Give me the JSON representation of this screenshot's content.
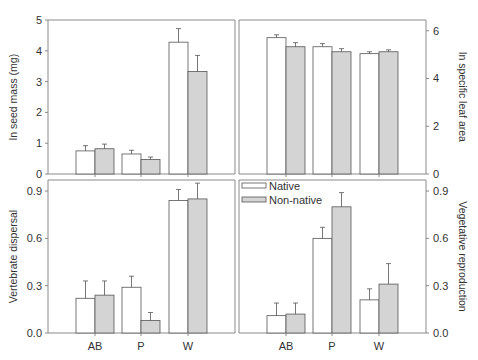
{
  "chart_data": [
    {
      "type": "bar",
      "panel": "top-left",
      "title": "",
      "xlabel": "",
      "ylabel": "ln seed mass (mg)",
      "yaxis_side": "left",
      "ylim": [
        0,
        5
      ],
      "yticks": [
        "0",
        "1",
        "2",
        "3",
        "4",
        "5"
      ],
      "ytick_values": [
        0,
        1,
        2,
        3,
        4,
        5
      ],
      "categories": [
        "AB",
        "P",
        "W"
      ],
      "show_category_labels": false,
      "grid": false,
      "series": [
        {
          "name": "Native",
          "values": [
            0.75,
            0.65,
            4.28
          ],
          "errors": [
            0.17,
            0.12,
            0.44
          ]
        },
        {
          "name": "Non-native",
          "values": [
            0.82,
            0.47,
            3.33
          ],
          "errors": [
            0.15,
            0.08,
            0.52
          ]
        }
      ]
    },
    {
      "type": "bar",
      "panel": "top-right",
      "title": "",
      "xlabel": "",
      "ylabel": "ln specific leaf area",
      "yaxis_side": "right",
      "ylim": [
        0,
        6.45
      ],
      "yticks": [
        "0",
        "2",
        "4",
        "6"
      ],
      "ytick_values": [
        0,
        2,
        4,
        6
      ],
      "categories": [
        "AB",
        "P",
        "W"
      ],
      "show_category_labels": false,
      "grid": false,
      "series": [
        {
          "name": "Native",
          "values": [
            5.71,
            5.33,
            5.04
          ],
          "errors": [
            0.12,
            0.13,
            0.08
          ]
        },
        {
          "name": "Non-native",
          "values": [
            5.33,
            5.12,
            5.12
          ],
          "errors": [
            0.17,
            0.13,
            0.08
          ]
        }
      ]
    },
    {
      "type": "bar",
      "panel": "bottom-left",
      "title": "",
      "xlabel": "",
      "ylabel": "Vertebrate dispersal",
      "yaxis_side": "left",
      "ylim": [
        0,
        0.97
      ],
      "yticks": [
        "0.0",
        "0.3",
        "0.6",
        "0.9"
      ],
      "ytick_values": [
        0,
        0.3,
        0.6,
        0.9
      ],
      "categories": [
        "AB",
        "P",
        "W"
      ],
      "show_category_labels": true,
      "grid": false,
      "series": [
        {
          "name": "Native",
          "values": [
            0.22,
            0.29,
            0.84
          ],
          "errors": [
            0.11,
            0.07,
            0.07
          ]
        },
        {
          "name": "Non-native",
          "values": [
            0.24,
            0.08,
            0.85
          ],
          "errors": [
            0.09,
            0.05,
            0.1
          ]
        }
      ]
    },
    {
      "type": "bar",
      "panel": "bottom-right",
      "title": "",
      "xlabel": "",
      "ylabel": "Vegetative reproduction",
      "yaxis_side": "right",
      "ylim": [
        0,
        0.97
      ],
      "yticks": [
        "0.0",
        "0.3",
        "0.6",
        "0.9"
      ],
      "ytick_values": [
        0,
        0.3,
        0.6,
        0.9
      ],
      "categories": [
        "AB",
        "P",
        "W"
      ],
      "show_category_labels": true,
      "grid": false,
      "legend": {
        "placement": "top-left",
        "entries": [
          "Native",
          "Non-native"
        ]
      },
      "series": [
        {
          "name": "Native",
          "values": [
            0.11,
            0.6,
            0.21
          ],
          "errors": [
            0.08,
            0.07,
            0.07
          ]
        },
        {
          "name": "Non-native",
          "values": [
            0.12,
            0.8,
            0.31
          ],
          "errors": [
            0.07,
            0.09,
            0.13
          ]
        }
      ]
    }
  ],
  "legend": {
    "native_label": "Native",
    "nonnative_label": "Non-native"
  },
  "colors": {
    "native_fill": "#ffffff",
    "nonnative_fill": "#d4d4d4",
    "axis": "#8a8a8a",
    "bar_stroke": "#555555",
    "text": "#333333"
  }
}
